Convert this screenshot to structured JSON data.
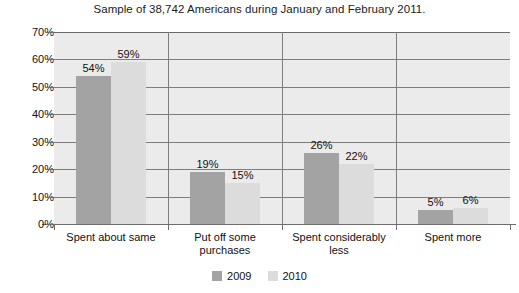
{
  "chart_data": {
    "type": "bar",
    "title": "Sample of 38,742 Americans during January and February 2011.",
    "xlabel": "",
    "ylabel": "",
    "ylim": [
      0,
      70
    ],
    "ytick_labels": [
      "0%",
      "10%",
      "20%",
      "30%",
      "40%",
      "50%",
      "60%",
      "70%"
    ],
    "ytick_values": [
      0,
      10,
      20,
      30,
      40,
      50,
      60,
      70
    ],
    "grid": true,
    "legend_position": "bottom",
    "categories": [
      "Spent about same",
      "Put off some purchases",
      "Spent considerably less",
      "Spent more"
    ],
    "category_lines": [
      [
        "Spent about same"
      ],
      [
        "Put off some",
        "purchases"
      ],
      [
        "Spent considerably",
        "less"
      ],
      [
        "Spent more"
      ]
    ],
    "series": [
      {
        "name": "2009",
        "color": "#a3a3a3",
        "values": [
          54,
          19,
          26,
          5
        ],
        "labels": [
          "54%",
          "19%",
          "26%",
          "5%"
        ]
      },
      {
        "name": "2010",
        "color": "#dcdcdc",
        "values": [
          59,
          15,
          22,
          6
        ],
        "labels": [
          "59%",
          "15%",
          "22%",
          "6%"
        ]
      }
    ]
  },
  "legend": {
    "items": [
      {
        "label": "2009",
        "swatch": "legend-swatch-2009"
      },
      {
        "label": "2010",
        "swatch": "legend-swatch-2010"
      }
    ]
  },
  "plot": {
    "background_color": "#ebebeb",
    "gridline_color": "#7d7d7d",
    "axis_color": "#6e6e6e"
  }
}
